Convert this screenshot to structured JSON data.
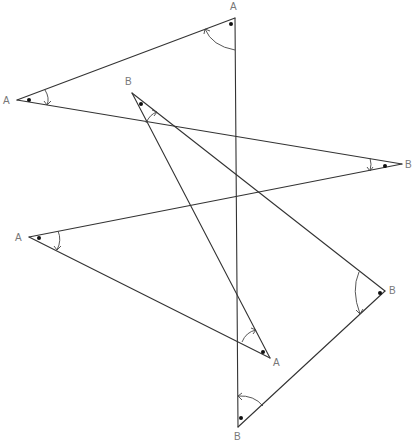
{
  "diagram": {
    "type": "zigzag-polygon-angle-marks",
    "stroke_color": "#333333",
    "label_color": "#777777",
    "vertices": [
      {
        "id": "v1",
        "label": "A",
        "x": 235,
        "y": 18,
        "lx": 233,
        "ly": 10
      },
      {
        "id": "v2",
        "label": "A",
        "x": 17,
        "y": 100,
        "lx": 4,
        "ly": 104
      },
      {
        "id": "v3",
        "label": "B",
        "x": 402,
        "y": 164,
        "lx": 405,
        "ly": 168
      },
      {
        "id": "v4",
        "label": "A",
        "x": 29,
        "y": 237,
        "lx": 15,
        "ly": 241
      },
      {
        "id": "v5",
        "label": "A",
        "x": 270,
        "y": 358,
        "lx": 273,
        "ly": 366
      },
      {
        "id": "v6",
        "label": "B",
        "x": 132,
        "y": 93,
        "lx": 125,
        "ly": 84
      },
      {
        "id": "v7",
        "label": "B",
        "x": 385,
        "y": 291,
        "lx": 390,
        "ly": 294
      },
      {
        "id": "v8",
        "label": "B",
        "x": 238,
        "y": 427,
        "lx": 235,
        "ly": 440
      }
    ],
    "edges": [
      [
        "v1",
        "v2"
      ],
      [
        "v2",
        "v3"
      ],
      [
        "v3",
        "v4"
      ],
      [
        "v4",
        "v5"
      ],
      [
        "v5",
        "v6"
      ],
      [
        "v6",
        "v7"
      ],
      [
        "v7",
        "v8"
      ],
      [
        "v8",
        "v1"
      ]
    ]
  }
}
